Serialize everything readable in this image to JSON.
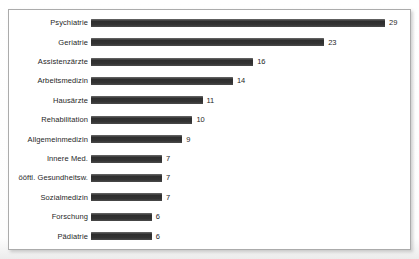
{
  "chart_data": {
    "type": "bar",
    "orientation": "horizontal",
    "title": "",
    "xlabel": "",
    "ylabel": "",
    "categories": [
      "Psychiatrie",
      "Geriatrie",
      "Assistenzärzte",
      "Arbeitsmedizin",
      "Hausärzte",
      "Rehabilitation",
      "Allgemeinmedizin",
      "Innere Med.",
      "ööftl. Gesundheitsw.",
      "Sozialmedizin",
      "Forschung",
      "Pädiatrie"
    ],
    "values": [
      29,
      23,
      16,
      14,
      11,
      10,
      9,
      7,
      7,
      7,
      6,
      6
    ],
    "xlim": [
      0,
      29
    ],
    "grid": false,
    "legend": false,
    "data_labels": true,
    "bar_color": "#3a3a3a",
    "frame_border_color": "#ababab",
    "background_color": "#ffffff"
  }
}
